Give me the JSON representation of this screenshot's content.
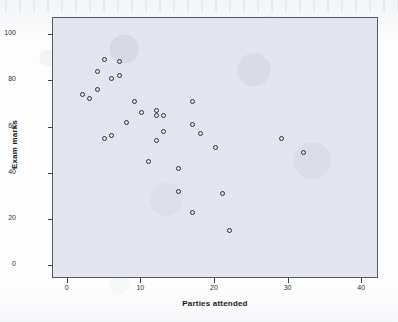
{
  "chart_data": {
    "type": "scatter",
    "title": "",
    "xlabel": "Parties attended",
    "ylabel": "Exam marks",
    "xlim": [
      -2,
      42
    ],
    "ylim": [
      -5,
      107
    ],
    "xticks": [
      0,
      10,
      20,
      30,
      40
    ],
    "yticks": [
      0,
      20,
      40,
      60,
      80,
      100
    ],
    "grid": false,
    "legend": null,
    "marker": "open-circle",
    "marker_color": "#2b2f3e",
    "plot_background": "#e3e6ee",
    "points": [
      {
        "x": 2,
        "y": 74
      },
      {
        "x": 3,
        "y": 72
      },
      {
        "x": 4,
        "y": 84
      },
      {
        "x": 4,
        "y": 76
      },
      {
        "x": 5,
        "y": 89
      },
      {
        "x": 5,
        "y": 55
      },
      {
        "x": 6,
        "y": 56
      },
      {
        "x": 6,
        "y": 81
      },
      {
        "x": 7,
        "y": 88
      },
      {
        "x": 7,
        "y": 82
      },
      {
        "x": 8,
        "y": 62
      },
      {
        "x": 9,
        "y": 71
      },
      {
        "x": 10,
        "y": 66
      },
      {
        "x": 11,
        "y": 45
      },
      {
        "x": 12,
        "y": 54
      },
      {
        "x": 12,
        "y": 67
      },
      {
        "x": 12,
        "y": 65
      },
      {
        "x": 13,
        "y": 58
      },
      {
        "x": 13,
        "y": 65
      },
      {
        "x": 15,
        "y": 42
      },
      {
        "x": 15,
        "y": 32
      },
      {
        "x": 17,
        "y": 71
      },
      {
        "x": 17,
        "y": 61
      },
      {
        "x": 17,
        "y": 23
      },
      {
        "x": 18,
        "y": 57
      },
      {
        "x": 20,
        "y": 51
      },
      {
        "x": 21,
        "y": 31
      },
      {
        "x": 22,
        "y": 15
      },
      {
        "x": 29,
        "y": 55
      },
      {
        "x": 32,
        "y": 49
      }
    ]
  }
}
